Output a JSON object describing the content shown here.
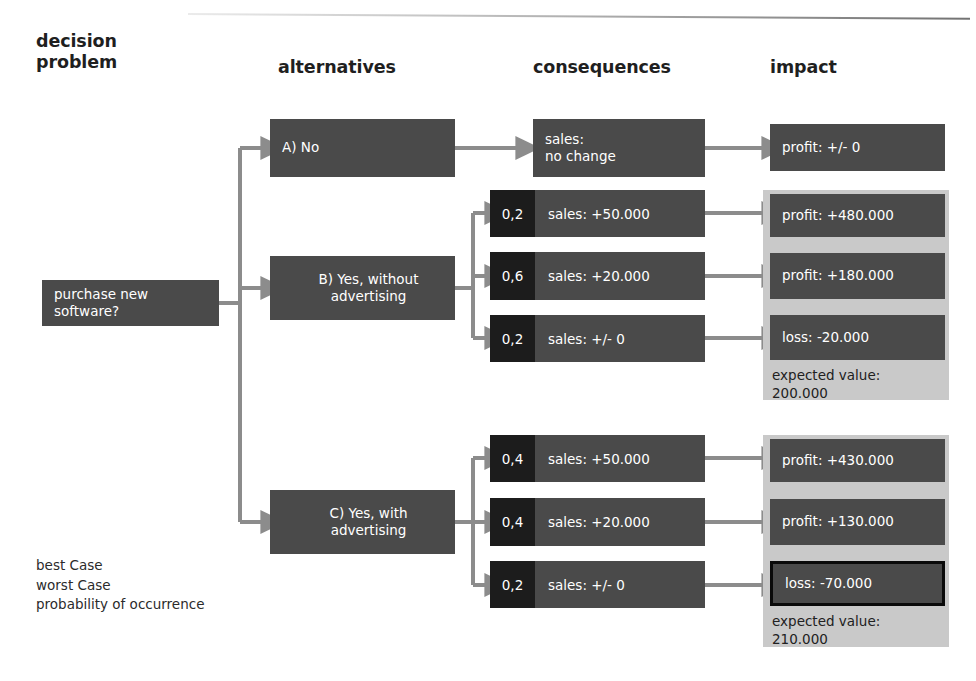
{
  "columns": {
    "decision_problem": "decision\nproblem",
    "alternatives": "alternatives",
    "consequences": "consequences",
    "impact": "impact"
  },
  "root": {
    "label": "purchase new\nsoftware?"
  },
  "branches": [
    {
      "id": "A",
      "alternative": "A) No",
      "consequences": [
        {
          "probability": "",
          "sales": "sales:\nno change"
        }
      ],
      "impacts": [
        {
          "label": "profit: +/- 0",
          "emphasis": "none"
        }
      ],
      "expected_value": null,
      "grouped": false
    },
    {
      "id": "B",
      "alternative": "B) Yes, without\nadvertising",
      "consequences": [
        {
          "probability": "0,2",
          "sales": "sales: +50.000"
        },
        {
          "probability": "0,6",
          "sales": "sales: +20.000"
        },
        {
          "probability": "0,2",
          "sales": "sales: +/- 0"
        }
      ],
      "impacts": [
        {
          "label": "profit: +480.000",
          "emphasis": "none"
        },
        {
          "label": "profit: +180.000",
          "emphasis": "none"
        },
        {
          "label": "loss: -20.000",
          "emphasis": "none"
        }
      ],
      "expected_value": "expected value:\n200.000",
      "grouped": true
    },
    {
      "id": "C",
      "alternative": "C) Yes, with\nadvertising",
      "consequences": [
        {
          "probability": "0,4",
          "sales": "sales: +50.000"
        },
        {
          "probability": "0,4",
          "sales": "sales: +20.000"
        },
        {
          "probability": "0,2",
          "sales": "sales: +/- 0"
        }
      ],
      "impacts": [
        {
          "label": "profit: +430.000",
          "emphasis": "none"
        },
        {
          "label": "profit: +130.000",
          "emphasis": "none"
        },
        {
          "label": "loss: -70.000",
          "emphasis": "worst-case"
        }
      ],
      "expected_value": "expected value:\n210.000",
      "grouped": true
    }
  ],
  "legend": [
    "best Case",
    "worst Case",
    "probability of occurrence"
  ],
  "colors": {
    "node_fill": "#4a4a4a",
    "probability_fill": "#1c1c1c",
    "group_panel_fill": "#c9c9c9",
    "connector": "#8c8c8c",
    "emphasis_border": "#0a0a0a",
    "page_background": "#ffffff",
    "node_text": "#ffffff",
    "heading_text": "#1f1f1f"
  }
}
